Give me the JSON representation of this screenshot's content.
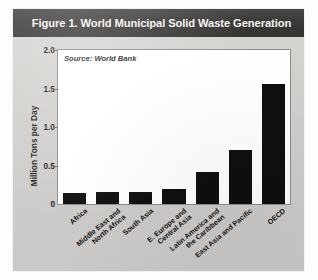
{
  "figure": {
    "title": "Figure 1. World Municipal Solid Waste Generation",
    "source_note": "Source: World Bank",
    "panel_color": "#d4d2cf",
    "title_bar_color": "#3b3937",
    "bar_color": "#100f0f",
    "plot_background": "#ffffff"
  },
  "chart_data": {
    "type": "bar",
    "title": "Figure 1. World Municipal Solid Waste Generation",
    "subtitle": "Source: World Bank",
    "xlabel": "",
    "ylabel": "Million Tons per Day",
    "ylim": [
      0,
      2.0
    ],
    "ytick_labels": [
      "0",
      "0.5",
      "1.0",
      "1.5",
      "2.0"
    ],
    "ytick_values": [
      0,
      0.5,
      1.0,
      1.5,
      2.0
    ],
    "grid": false,
    "legend": false,
    "categories": [
      "Africa",
      "Middle East and\nNorth Africa",
      "South Asia",
      "E. Europe and\nCentral Asia",
      "Latin America and\nthe Caribbean",
      "East Asia and Pacific",
      "OECD"
    ],
    "category_lines": [
      [
        "Africa"
      ],
      [
        "Middle East and",
        "North Africa"
      ],
      [
        "South Asia"
      ],
      [
        "E. Europe and",
        "Central Asia"
      ],
      [
        "Latin America and",
        "the Caribbean"
      ],
      [
        "East Asia and Pacific"
      ],
      [
        "OECD"
      ]
    ],
    "values": [
      0.14,
      0.15,
      0.16,
      0.2,
      0.41,
      0.7,
      1.56
    ],
    "units": "Million Tons per Day"
  }
}
